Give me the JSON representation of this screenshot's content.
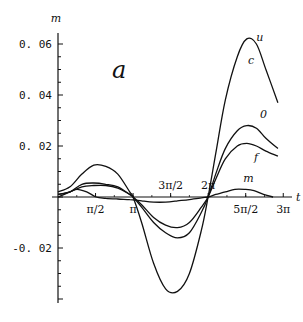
{
  "chart_data": {
    "type": "line",
    "title": "",
    "panel_label": "a",
    "xlabel": "t",
    "ylabel": "m",
    "xlim": [
      0,
      9.42
    ],
    "ylim": [
      -0.04,
      0.065
    ],
    "grid": false,
    "legend": "inline labels",
    "x_ticks": [
      {
        "value": 1.5708,
        "label": "π/2"
      },
      {
        "value": 3.1416,
        "label": "π"
      },
      {
        "value": 4.7124,
        "label": "3π/2"
      },
      {
        "value": 6.2832,
        "label": "2π"
      },
      {
        "value": 7.854,
        "label": "5π/2"
      },
      {
        "value": 9.4248,
        "label": "3π"
      }
    ],
    "y_ticks": [
      {
        "value": 0.06,
        "label": "0.06"
      },
      {
        "value": 0.04,
        "label": "0.04"
      },
      {
        "value": 0.02,
        "label": "0.02"
      },
      {
        "value": -0.02,
        "label": "-0.02"
      }
    ],
    "series": [
      {
        "name": "u",
        "label_pos": [
          8.3,
          0.061
        ],
        "x": [
          0,
          0.5,
          1.0,
          1.5,
          2.0,
          2.5,
          3.0,
          3.14,
          3.5,
          4.0,
          4.5,
          5.0,
          5.5,
          6.0,
          6.28,
          6.6,
          7.0,
          7.5,
          7.9,
          8.3,
          8.7,
          9.2
        ],
        "y": [
          0.002,
          0.004,
          0.009,
          0.0125,
          0.012,
          0.009,
          0.002,
          0.0,
          -0.01,
          -0.026,
          -0.036,
          -0.037,
          -0.03,
          -0.013,
          0.0,
          0.017,
          0.038,
          0.055,
          0.062,
          0.06,
          0.05,
          0.037
        ]
      },
      {
        "name": "c",
        "label_pos": [
          7.95,
          0.052
        ],
        "note": "label shown alongside u",
        "x": [],
        "y": []
      },
      {
        "name": "0",
        "label_pos": [
          8.45,
          0.031
        ],
        "x": [
          0,
          0.5,
          1.0,
          1.5,
          2.0,
          2.5,
          3.0,
          3.14,
          3.5,
          4.0,
          4.5,
          5.0,
          5.5,
          6.0,
          6.28,
          6.6,
          7.0,
          7.5,
          7.9,
          8.3,
          8.7,
          9.2
        ],
        "y": [
          0.001,
          0.002,
          0.005,
          0.0055,
          0.005,
          0.004,
          0.001,
          0.0,
          -0.004,
          -0.01,
          -0.014,
          -0.016,
          -0.014,
          -0.006,
          0.0,
          0.009,
          0.019,
          0.026,
          0.028,
          0.027,
          0.023,
          0.019
        ]
      },
      {
        "name": "f",
        "label_pos": [
          8.2,
          0.014
        ],
        "x": [
          0,
          0.5,
          1.0,
          1.5,
          2.0,
          2.5,
          3.0,
          3.14,
          3.5,
          4.0,
          4.5,
          5.0,
          5.5,
          6.0,
          6.28,
          6.6,
          7.0,
          7.5,
          7.9,
          8.3,
          8.7,
          9.2
        ],
        "y": [
          0.001,
          0.002,
          0.004,
          0.0045,
          0.0045,
          0.0035,
          0.001,
          0.0,
          -0.003,
          -0.008,
          -0.011,
          -0.012,
          -0.01,
          -0.004,
          0.0,
          0.007,
          0.015,
          0.02,
          0.021,
          0.02,
          0.018,
          0.016
        ]
      },
      {
        "name": "m",
        "label_pos": [
          7.75,
          0.006
        ],
        "x": [
          0,
          0.5,
          0.8,
          1.2,
          1.6,
          2.0,
          2.5,
          3.0,
          3.5,
          4.0,
          4.5,
          5.0,
          5.5,
          6.0,
          6.28,
          6.6,
          7.0,
          7.4,
          7.8,
          8.2,
          8.6,
          9.0
        ],
        "y": [
          0.0,
          0.002,
          0.003,
          0.002,
          0.0,
          -0.0005,
          -0.0008,
          -0.001,
          -0.0015,
          -0.002,
          -0.002,
          -0.0015,
          -0.001,
          -0.0003,
          0.0,
          0.001,
          0.002,
          0.003,
          0.003,
          0.0025,
          0.001,
          0.0
        ]
      }
    ]
  },
  "layout": {
    "origin_px": [
      58,
      197
    ],
    "px_per_unit_x": 23.9,
    "px_per_unit_y": 2550
  }
}
